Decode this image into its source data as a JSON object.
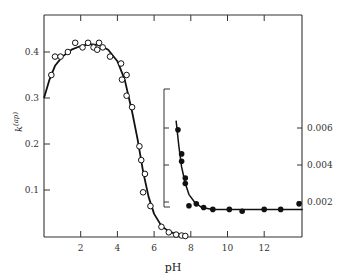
{
  "chart_data": [
    {
      "type": "scatter",
      "title": "",
      "xlabel": "pH",
      "ylabel": "k(ap)",
      "xlim": [
        0,
        14.1
      ],
      "ylim": [
        0,
        0.48
      ],
      "x_ticks": [
        2,
        4,
        6,
        8,
        10,
        12
      ],
      "y_ticks": [
        0.1,
        0.2,
        0.3,
        0.4
      ],
      "y_tick_labels": [
        "0.1",
        "0.2",
        "0.3",
        "0.4"
      ],
      "grid": false,
      "legend": null,
      "series": [
        {
          "name": "observed (open circles)",
          "marker": "open-circle",
          "points": [
            [
              0.4,
              0.35
            ],
            [
              0.6,
              0.39
            ],
            [
              0.9,
              0.39
            ],
            [
              1.3,
              0.4
            ],
            [
              1.7,
              0.42
            ],
            [
              2.1,
              0.41
            ],
            [
              2.4,
              0.42
            ],
            [
              2.7,
              0.41
            ],
            [
              2.9,
              0.405
            ],
            [
              3.0,
              0.42
            ],
            [
              3.2,
              0.41
            ],
            [
              3.6,
              0.39
            ],
            [
              4.2,
              0.375
            ],
            [
              4.25,
              0.34
            ],
            [
              4.5,
              0.35
            ],
            [
              4.5,
              0.305
            ],
            [
              4.8,
              0.28
            ],
            [
              5.2,
              0.195
            ],
            [
              5.3,
              0.165
            ],
            [
              5.5,
              0.135
            ],
            [
              5.4,
              0.095
            ],
            [
              5.8,
              0.065
            ],
            [
              6.4,
              0.02
            ],
            [
              6.8,
              0.008
            ],
            [
              7.2,
              0.003
            ],
            [
              7.5,
              0.001
            ],
            [
              7.7,
              0.0
            ]
          ]
        },
        {
          "name": "fitted curve",
          "marker": "line",
          "points": [
            [
              0.0,
              0.3
            ],
            [
              0.3,
              0.34
            ],
            [
              0.6,
              0.37
            ],
            [
              1.0,
              0.39
            ],
            [
              1.5,
              0.405
            ],
            [
              2.0,
              0.413
            ],
            [
              2.5,
              0.417
            ],
            [
              3.0,
              0.415
            ],
            [
              3.5,
              0.405
            ],
            [
              4.0,
              0.38
            ],
            [
              4.4,
              0.34
            ],
            [
              4.8,
              0.27
            ],
            [
              5.1,
              0.21
            ],
            [
              5.4,
              0.14
            ],
            [
              5.7,
              0.085
            ],
            [
              6.0,
              0.048
            ],
            [
              6.4,
              0.022
            ],
            [
              6.8,
              0.01
            ],
            [
              7.2,
              0.004
            ],
            [
              7.7,
              0.001
            ]
          ]
        }
      ]
    },
    {
      "type": "scatter",
      "title": "inset",
      "xlabel": "pH",
      "ylabel": "",
      "xlim": [
        6.5,
        14.1
      ],
      "ylim": [
        0,
        0.0068
      ],
      "y_axis_position": "right",
      "y_ticks": [
        0.002,
        0.004,
        0.006
      ],
      "y_tick_labels": [
        "0.002",
        "0.004",
        "0.006"
      ],
      "x_ticks": [
        8,
        10,
        12
      ],
      "grid": false,
      "series": [
        {
          "name": "observed (filled circles)",
          "marker": "filled-circle",
          "points": [
            [
              7.3,
              0.0059
            ],
            [
              7.5,
              0.0046
            ],
            [
              7.5,
              0.0042
            ],
            [
              7.7,
              0.0033
            ],
            [
              7.7,
              0.003
            ],
            [
              7.9,
              0.0018
            ],
            [
              8.3,
              0.0019
            ],
            [
              8.7,
              0.0017
            ],
            [
              9.2,
              0.0016
            ],
            [
              10.1,
              0.0016
            ],
            [
              10.8,
              0.0015
            ],
            [
              12.0,
              0.0016
            ],
            [
              12.9,
              0.0016
            ],
            [
              13.9,
              0.0019
            ]
          ]
        },
        {
          "name": "fitted curve",
          "marker": "line",
          "points": [
            [
              7.2,
              0.0064
            ],
            [
              7.35,
              0.005
            ],
            [
              7.5,
              0.0039
            ],
            [
              7.7,
              0.003
            ],
            [
              7.9,
              0.0024
            ],
            [
              8.2,
              0.002
            ],
            [
              8.6,
              0.0017
            ],
            [
              9.2,
              0.0016
            ],
            [
              10.0,
              0.0016
            ],
            [
              14.1,
              0.0016
            ]
          ]
        }
      ]
    }
  ],
  "labels": {
    "xlabel": "pH",
    "ylabel_main": "k",
    "ylabel_sup": "(ap)",
    "x_ticks": [
      "2",
      "4",
      "6",
      "8",
      "10",
      "12"
    ],
    "left_y_ticks": [
      "0.1",
      "0.2",
      "0.3",
      "0.4"
    ],
    "right_y_ticks": [
      "0.002",
      "0.004",
      "0.006"
    ]
  }
}
